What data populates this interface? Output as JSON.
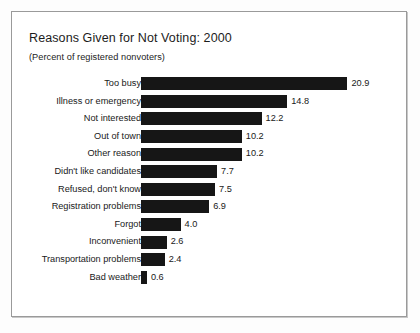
{
  "chart": {
    "title": "Reasons Given for Not Voting: 2000",
    "subtitle": "(Percent of registered nonvoters)"
  },
  "chart_data": {
    "type": "bar",
    "orientation": "horizontal",
    "title": "Reasons Given for Not Voting: 2000",
    "subtitle": "(Percent of registered nonvoters)",
    "xlabel": "",
    "ylabel": "",
    "xlim": [
      0,
      20.9
    ],
    "grid": false,
    "legend": null,
    "value_labels": true,
    "bar_color": "#161616",
    "categories": [
      "Too busy",
      "Illness or emergency",
      "Not interested",
      "Out of town",
      "Other reason",
      "Didn't like candidates",
      "Refused, don't know",
      "Registration problems",
      "Forgot",
      "Inconvenient",
      "Transportation problems",
      "Bad weather"
    ],
    "values": [
      20.9,
      14.8,
      12.2,
      10.2,
      10.2,
      7.7,
      7.5,
      6.9,
      4.0,
      2.6,
      2.4,
      0.6
    ],
    "value_text": [
      "20.9",
      "14.8",
      "12.2",
      "10.2",
      "10.2",
      "7.7",
      "7.5",
      "6.9",
      "4.0",
      "2.6",
      "2.4",
      "0.6"
    ]
  }
}
